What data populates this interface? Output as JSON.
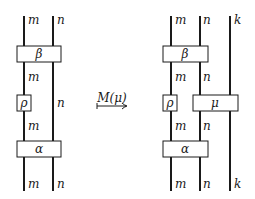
{
  "left_diagram": {
    "wires": {
      "m": "m",
      "n": "n"
    },
    "labels": {
      "top_m": "m",
      "top_n": "n",
      "mid_m_upper": "m",
      "mid_n": "n",
      "mid_m_lower": "m",
      "bottom_m": "m",
      "bottom_n": "n"
    },
    "boxes": {
      "beta": "β",
      "rho": "ρ",
      "alpha": "α"
    }
  },
  "arrow": {
    "label": "M(μ)"
  },
  "right_diagram": {
    "labels": {
      "top_m": "m",
      "top_n": "n",
      "top_k": "k",
      "mid_m_upper": "m",
      "mid_n_upper": "n",
      "mid_m_lower": "m",
      "mid_n_lower": "n",
      "bottom_m": "m",
      "bottom_n": "n",
      "bottom_k": "k"
    },
    "boxes": {
      "beta": "β",
      "rho": "ρ",
      "mu": "μ",
      "alpha": "α"
    }
  }
}
